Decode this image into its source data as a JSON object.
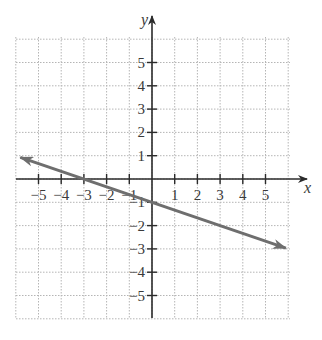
{
  "chart_data": {
    "type": "line",
    "title": "",
    "xlabel": "x",
    "ylabel": "y",
    "xlim": [
      -6,
      6
    ],
    "ylim": [
      -6,
      6
    ],
    "grid": true,
    "grid_style": "dotted",
    "x_ticks": [
      -5,
      -4,
      -3,
      -2,
      -1,
      1,
      2,
      3,
      4,
      5
    ],
    "y_ticks": [
      -5,
      -4,
      -3,
      -2,
      -1,
      1,
      2,
      3,
      4,
      5
    ],
    "x_tick_labels": [
      "−5",
      "−4",
      "−3",
      "−2",
      "−1",
      "1",
      "2",
      "3",
      "4",
      "5"
    ],
    "y_tick_labels": [
      "−5",
      "−4",
      "−3",
      "−2",
      "−1",
      "1",
      "2",
      "3",
      "4",
      "5"
    ],
    "series": [
      {
        "name": "line",
        "equation": "y = -x/3 - 1",
        "slope": -0.3333,
        "y_intercept": -1,
        "x_intercept": -3,
        "both_ends_arrows": true,
        "x": [
          -5.8,
          -3,
          0,
          5.9
        ],
        "y": [
          0.93,
          0,
          -1,
          -2.97
        ],
        "color": "#6e6e6e"
      }
    ],
    "legend": null
  },
  "colors": {
    "axis": "#2b2b2b",
    "grid": "#b5b5b5",
    "line": "#6e6e6e"
  }
}
